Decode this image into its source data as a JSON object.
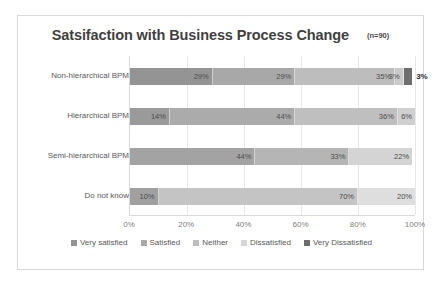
{
  "chart_data": {
    "type": "bar",
    "orientation": "horizontal",
    "stacked": true,
    "normalized_percent": true,
    "title": "Satsifaction with Business Process  Change",
    "sample_note": "(n=90)",
    "xlabel": "",
    "ylabel": "",
    "xlim": [
      0,
      100
    ],
    "xticks": [
      "0%",
      "20%",
      "40%",
      "60%",
      "80%",
      "100%"
    ],
    "xtick_values": [
      0,
      20,
      40,
      60,
      80,
      100
    ],
    "grid": true,
    "grid_axis": "x",
    "legend_position": "bottom",
    "categories": [
      "Non-hierarchical BPM",
      "Hierarchical BPM",
      "Semi-hierarchical BPM",
      "Do not know"
    ],
    "series": [
      {
        "name": "Very satisfied",
        "color": "#949494",
        "values": [
          29,
          14,
          44,
          10
        ],
        "labels": [
          "29%",
          "14%",
          "44%",
          "10%"
        ]
      },
      {
        "name": "Satisfied",
        "color": "#a6a6a6",
        "values": [
          29,
          44,
          0,
          0
        ],
        "labels": [
          "29%",
          "44%",
          "",
          ""
        ]
      },
      {
        "name": "Neither",
        "color": "#b8b8b8",
        "values": [
          35,
          36,
          33,
          70
        ],
        "labels": [
          "35%",
          "36%",
          "33%",
          "70%"
        ]
      },
      {
        "name": "Dissatisfied",
        "color": "#d2d2d2",
        "values": [
          3,
          6,
          22,
          20
        ],
        "labels": [
          "3%",
          "6%",
          "22%",
          "20%"
        ]
      },
      {
        "name": "Very Dissatisfied",
        "color": "#6e6e6e",
        "values": [
          3,
          0,
          0,
          0
        ],
        "labels": [
          "3%",
          "",
          "",
          ""
        ],
        "label_outside": true
      }
    ],
    "rows": [
      {
        "category": "Non-hierarchical BPM",
        "segments": [
          {
            "series": "Very satisfied",
            "value": 29,
            "label": "29%",
            "color": "#949494",
            "outside": false
          },
          {
            "series": "Satisfied",
            "value": 29,
            "label": "29%",
            "color": "#a8a8a8",
            "outside": false
          },
          {
            "series": "Neither",
            "value": 35,
            "label": "35%",
            "color": "#bdbdbd",
            "outside": false
          },
          {
            "series": "Dissatisfied",
            "value": 3,
            "label": "3%",
            "color": "#c9c9c9",
            "outside": false
          },
          {
            "series": "Very Dissatisfied",
            "value": 3,
            "label": "3%",
            "color": "#6e6e6e",
            "outside": true
          }
        ]
      },
      {
        "category": "Hierarchical BPM",
        "segments": [
          {
            "series": "Very satisfied",
            "value": 14,
            "label": "14%",
            "color": "#9a9a9a",
            "outside": false
          },
          {
            "series": "Satisfied",
            "value": 44,
            "label": "44%",
            "color": "#ababab",
            "outside": false
          },
          {
            "series": "Neither",
            "value": 36,
            "label": "36%",
            "color": "#bfbfbf",
            "outside": false
          },
          {
            "series": "Dissatisfied",
            "value": 6,
            "label": "6%",
            "color": "#cfcfcf",
            "outside": false
          }
        ]
      },
      {
        "category": "Semi-hierarchical BPM",
        "segments": [
          {
            "series": "Very satisfied",
            "value": 44,
            "label": "44%",
            "color": "#a3a3a3",
            "outside": false
          },
          {
            "series": "Neither",
            "value": 33,
            "label": "33%",
            "color": "#b5b5b5",
            "outside": false
          },
          {
            "series": "Dissatisfied",
            "value": 22,
            "label": "22%",
            "color": "#d4d4d4",
            "outside": false
          }
        ]
      },
      {
        "category": "Do not know",
        "segments": [
          {
            "series": "Very satisfied",
            "value": 10,
            "label": "10%",
            "color": "#a0a0a0",
            "outside": false
          },
          {
            "series": "Neither",
            "value": 70,
            "label": "70%",
            "color": "#c4c4c4",
            "outside": false
          },
          {
            "series": "Dissatisfied",
            "value": 20,
            "label": "20%",
            "color": "#dedede",
            "outside": false
          }
        ]
      }
    ],
    "legend": [
      {
        "label": "Very satisfied",
        "color": "#949494"
      },
      {
        "label": "Satisfied",
        "color": "#a8a8a8"
      },
      {
        "label": "Neither",
        "color": "#bdbdbd"
      },
      {
        "label": "Dissatisfied",
        "color": "#d6d6d6"
      },
      {
        "label": "Very Dissatisfied",
        "color": "#6e6e6e"
      }
    ]
  }
}
